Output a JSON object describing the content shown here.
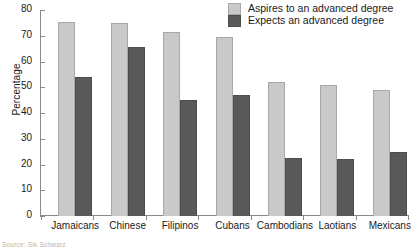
{
  "chart_data": {
    "type": "bar",
    "title": "",
    "subtitle": "",
    "xlabel": "",
    "ylabel": "Percentage",
    "ylim": [
      0,
      80
    ],
    "ytick_step": 10,
    "yticks": [
      0,
      10,
      20,
      30,
      40,
      50,
      60,
      70,
      80
    ],
    "grid": false,
    "legend_position": "top-right",
    "categories": [
      "Jamaicans",
      "Chinese",
      "Filipinos",
      "Cubans",
      "Cambodians",
      "Laotians",
      "Mexicans"
    ],
    "series": [
      {
        "name": "Aspires to an advanced degree",
        "color": "#c9c9c9",
        "values": [
          75.5,
          75,
          71.5,
          69.5,
          52,
          51,
          49
        ]
      },
      {
        "name": "Expects an advanced degree",
        "color": "#595959",
        "values": [
          54,
          65.5,
          45,
          47,
          22.5,
          22,
          25
        ]
      }
    ]
  },
  "legend": {
    "items": [
      {
        "label": "Aspires to an advanced degree"
      },
      {
        "label": "Expects an advanced degree"
      }
    ]
  },
  "axes": {
    "y_title": "Percentage"
  },
  "source": {
    "text": "Source: Sik Schwarz"
  },
  "colors": {
    "series_light": "#c9c9c9",
    "series_dark": "#595959",
    "axis": "#8a8a8a",
    "text": "#1a1a1a"
  }
}
